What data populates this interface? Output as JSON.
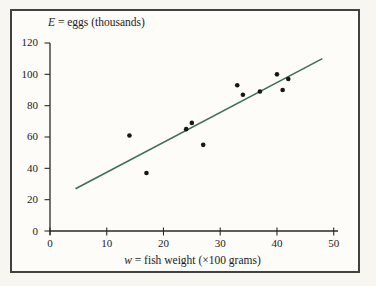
{
  "chart_data": {
    "type": "scatter",
    "ylabel_var": "E",
    "ylabel_rest": " = eggs (thousands)",
    "xlabel_var": "w",
    "xlabel_rest": " = fish weight (×100 grams)",
    "ylabel": "E = eggs (thousands)",
    "xlabel": "w = fish weight (×100 grams)",
    "xlim": [
      0,
      50
    ],
    "ylim": [
      0,
      120
    ],
    "x_ticks": [
      0,
      10,
      20,
      30,
      40,
      50
    ],
    "y_ticks": [
      0,
      20,
      40,
      60,
      80,
      100,
      120
    ],
    "grid": false,
    "points": [
      [
        14,
        61
      ],
      [
        17,
        37
      ],
      [
        24,
        65
      ],
      [
        25,
        69
      ],
      [
        27,
        55
      ],
      [
        33,
        93
      ],
      [
        34,
        87
      ],
      [
        37,
        89
      ],
      [
        40,
        100
      ],
      [
        41,
        90
      ],
      [
        42,
        97
      ]
    ],
    "trend_line": {
      "x_start": 4.5,
      "y_start": 27,
      "x_end": 48,
      "y_end": 110
    },
    "colors": {
      "point": "#171717",
      "trend_line": "#3e6f5b",
      "axis": "#2a2a2a",
      "frame_border": "#414141",
      "label_text": "#1b1b1b"
    }
  }
}
